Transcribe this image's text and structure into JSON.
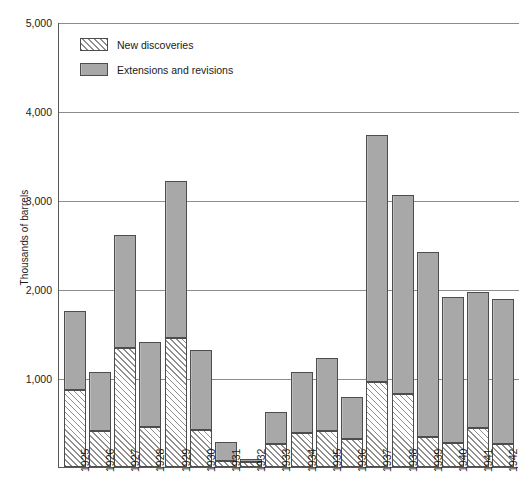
{
  "chart_data": {
    "type": "bar",
    "subtype": "stacked-vertical",
    "title": "",
    "xlabel": "",
    "ylabel": "Thousands of barrels",
    "ylim": [
      0,
      5000
    ],
    "yticks": [
      "1,000",
      "2,000",
      "3,000",
      "4,000",
      "5,000"
    ],
    "ytick_values": [
      1000,
      2000,
      3000,
      4000,
      5000
    ],
    "grid": true,
    "legend_position": "top-left",
    "categories": [
      "1925",
      "1926",
      "1927",
      "1928",
      "1929",
      "1930",
      "1931",
      "1932",
      "1933",
      "1934",
      "1935",
      "1936",
      "1937",
      "1938",
      "1939",
      "1940",
      "1941",
      "1942"
    ],
    "series": [
      {
        "name": "New discoveries",
        "style": "hatched",
        "values": [
          870,
          400,
          1340,
          450,
          1450,
          420,
          70,
          60,
          260,
          380,
          400,
          310,
          950,
          820,
          340,
          270,
          440,
          260
        ]
      },
      {
        "name": "Extensions and revisions",
        "style": "solid-gray",
        "values": [
          880,
          670,
          1270,
          950,
          1760,
          890,
          210,
          30,
          360,
          690,
          820,
          480,
          2780,
          2240,
          2080,
          1640,
          1530,
          1630
        ]
      }
    ],
    "totals": [
      1750,
      1070,
      2610,
      1400,
      3210,
      1310,
      280,
      90,
      620,
      1070,
      1220,
      790,
      3730,
      3060,
      2420,
      1910,
      1970,
      1890
    ]
  },
  "legend": {
    "items": [
      {
        "label": "New discoveries",
        "swatch": "hatched-swatch"
      },
      {
        "label": "Extensions and revisions",
        "swatch": "gray-swatch"
      }
    ]
  },
  "axis": {
    "y_title": "Thousands of barrels"
  },
  "colors": {
    "extensions_fill": "#a8a8a8",
    "new_discoveries_fill": "#ffffff",
    "hatch_stroke": "#8f8f8f",
    "bar_border": "#4d4d4d",
    "gridline": "#8c8c8c",
    "axis": "#595959",
    "text": "#1a1a1a",
    "background": "#ffffff"
  },
  "caption": ""
}
